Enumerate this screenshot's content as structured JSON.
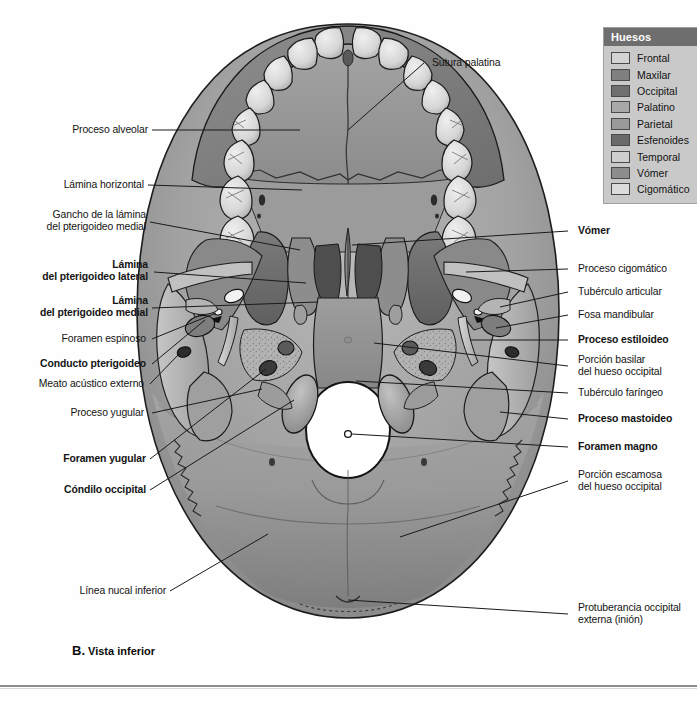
{
  "figure": {
    "caption_letter": "B.",
    "caption_text": " Vista inferior",
    "view": "Vista inferior"
  },
  "legend": {
    "title": "Huesos",
    "items": [
      {
        "label": "Frontal",
        "color": "#d3d3d3"
      },
      {
        "label": "Maxilar",
        "color": "#7f7f7f"
      },
      {
        "label": "Occipital",
        "color": "#6f6f6f"
      },
      {
        "label": "Palatino",
        "color": "#a8a8a8"
      },
      {
        "label": "Parietal",
        "color": "#9a9a9a"
      },
      {
        "label": "Esfenoides",
        "color": "#6a6a6a"
      },
      {
        "label": "Temporal",
        "color": "#cfcfcf"
      },
      {
        "label": "Vómer",
        "color": "#8d8d8d"
      },
      {
        "label": "Cigomático",
        "color": "#dcdcdc"
      }
    ]
  },
  "labels": {
    "top": [
      {
        "id": "sutura-palatina",
        "text": "Sutura palatina",
        "bold": false
      }
    ],
    "left": [
      {
        "id": "proceso-alveolar",
        "text": "Proceso alveolar",
        "bold": false
      },
      {
        "id": "lamina-horizontal",
        "text": "Lámina horizontal",
        "bold": false
      },
      {
        "id": "gancho-lamina-pterigoideo",
        "text": "Gancho de la lámina\ndel pterigoideo medial",
        "bold": false
      },
      {
        "id": "lamina-pterigoideo-lateral",
        "text": "Lámina\ndel pterigoideo lateral",
        "bold": true
      },
      {
        "id": "lamina-pterigoideo-medial",
        "text": "Lámina\ndel pterigoideo medial",
        "bold": true
      },
      {
        "id": "foramen-espinoso",
        "text": "Foramen espinoso",
        "bold": false
      },
      {
        "id": "conducto-pterigoideo",
        "text": "Conducto pterigoideo",
        "bold": true
      },
      {
        "id": "meato-acustico-externo",
        "text": "Meato acústico externo",
        "bold": false
      },
      {
        "id": "proceso-yugular",
        "text": "Proceso yugular",
        "bold": false
      },
      {
        "id": "foramen-yugular",
        "text": "Foramen yugular",
        "bold": true
      },
      {
        "id": "condilo-occipital",
        "text": "Cóndilo occipital",
        "bold": true
      },
      {
        "id": "linea-nucal-inferior",
        "text": "Línea nucal inferior",
        "bold": false
      }
    ],
    "right": [
      {
        "id": "vomer",
        "text": "Vómer",
        "bold": true
      },
      {
        "id": "proceso-cigomatico",
        "text": "Proceso cigomático",
        "bold": false
      },
      {
        "id": "tuberculo-articular",
        "text": "Tubérculo articular",
        "bold": false
      },
      {
        "id": "fosa-mandibular",
        "text": "Fosa mandibular",
        "bold": false
      },
      {
        "id": "proceso-estiloideo",
        "text": "Proceso estiloideo",
        "bold": true
      },
      {
        "id": "porcion-basilar",
        "text": "Porción basilar\ndel hueso occipital",
        "bold": false
      },
      {
        "id": "tuberculo-faringeo",
        "text": "Tubérculo faríngeo",
        "bold": false
      },
      {
        "id": "proceso-mastoideo",
        "text": "Proceso mastoideo",
        "bold": true
      },
      {
        "id": "foramen-magno",
        "text": "Foramen magno",
        "bold": true
      },
      {
        "id": "porcion-escamosa",
        "text": "Porción escamosa\ndel hueso occipital",
        "bold": false
      },
      {
        "id": "protuberancia-occipital",
        "text": "Protuberancia occipital\nexterna (inión)",
        "bold": false
      }
    ]
  }
}
